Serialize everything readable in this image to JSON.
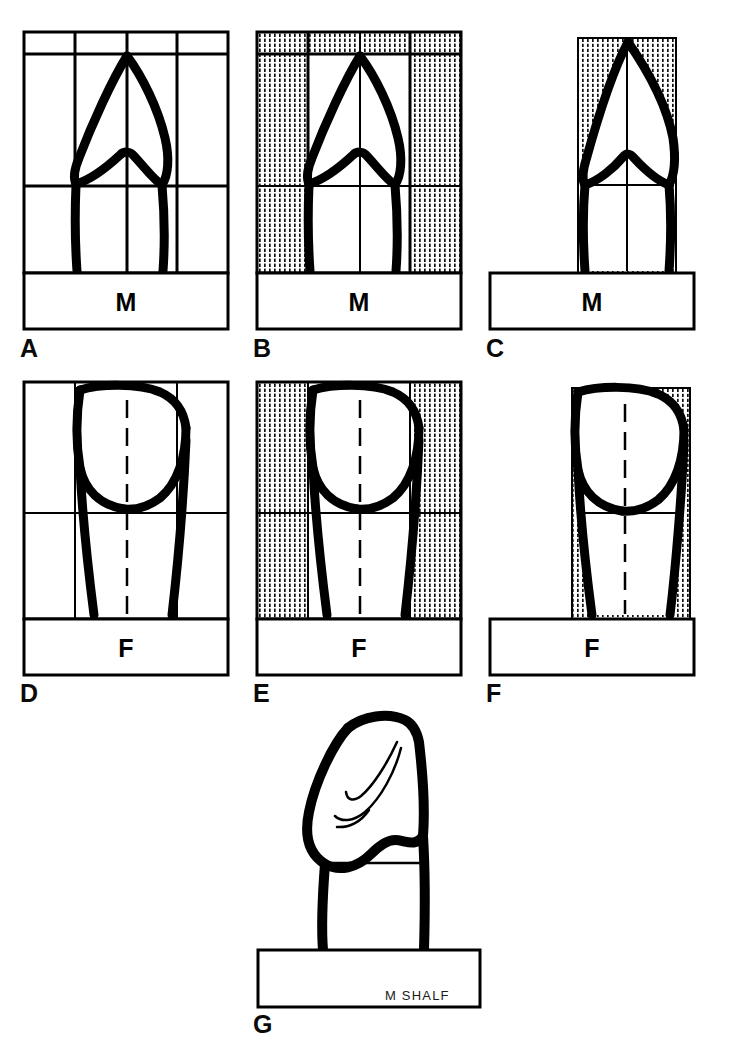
{
  "figure": {
    "ink_color": "#000000",
    "grid_color": "#000000",
    "stipple_color": "#1a1a1a",
    "background": "#ffffff",
    "signature": "M SHALF",
    "panel_letters": [
      "A",
      "B",
      "C",
      "D",
      "E",
      "F",
      "G"
    ],
    "base_labels": [
      "M",
      "F"
    ]
  },
  "panels": [
    {
      "id": "A",
      "letter": "A",
      "row": 1,
      "column": 1,
      "base_label": "M",
      "view": "mesial",
      "grid": {
        "columns": 4,
        "rows": 3,
        "visible": true,
        "shaded": false
      },
      "midline_style": "solid",
      "outline_kind": "mesial-incisor",
      "stipple": "none"
    },
    {
      "id": "B",
      "letter": "B",
      "row": 1,
      "column": 2,
      "base_label": "M",
      "view": "mesial",
      "grid": {
        "columns": 4,
        "rows": 3,
        "visible": true,
        "shaded": true
      },
      "midline_style": "solid",
      "outline_kind": "mesial-incisor",
      "stipple": "outer-columns-and-top-band"
    },
    {
      "id": "C",
      "letter": "C",
      "row": 1,
      "column": 3,
      "base_label": "M",
      "view": "mesial",
      "grid": {
        "columns": 2,
        "rows": 2,
        "visible": true,
        "shaded": true
      },
      "midline_style": "solid",
      "outline_kind": "mesial-incisor-narrow",
      "stipple": "inside-bounding-box"
    },
    {
      "id": "D",
      "letter": "D",
      "row": 2,
      "column": 1,
      "base_label": "F",
      "view": "facial",
      "grid": {
        "columns": 4,
        "rows": 3,
        "visible": true,
        "shaded": false
      },
      "midline_style": "dashed",
      "outline_kind": "facial-incisor",
      "stipple": "none"
    },
    {
      "id": "E",
      "letter": "E",
      "row": 2,
      "column": 2,
      "base_label": "F",
      "view": "facial",
      "grid": {
        "columns": 4,
        "rows": 3,
        "visible": true,
        "shaded": true
      },
      "midline_style": "dashed",
      "outline_kind": "facial-incisor",
      "stipple": "outer-columns"
    },
    {
      "id": "F",
      "letter": "F",
      "row": 2,
      "column": 3,
      "base_label": "F",
      "view": "facial",
      "grid": {
        "columns": 2,
        "rows": 2,
        "visible": true,
        "shaded": true
      },
      "midline_style": "dashed",
      "outline_kind": "facial-incisor-narrow",
      "stipple": "inside-bounding-box"
    },
    {
      "id": "G",
      "letter": "G",
      "row": 3,
      "column": 2,
      "base_label": "",
      "view": "oblique",
      "grid": {
        "columns": 0,
        "rows": 0,
        "visible": false,
        "shaded": false
      },
      "midline_style": "none",
      "outline_kind": "oblique-crown",
      "stipple": "none"
    }
  ]
}
